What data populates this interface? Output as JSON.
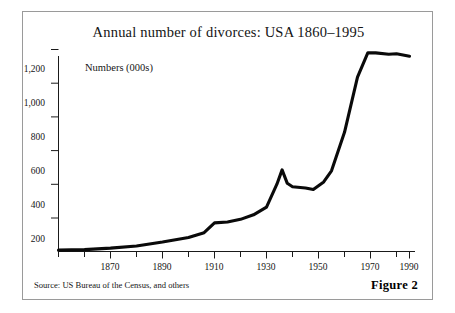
{
  "figure": {
    "title": "Annual number of divorces:  USA 1860–1995",
    "source_note": "Source: US Bureau of the Census, and others",
    "figure_number": "Figure 2",
    "border_color": "#9a9a9a",
    "line_color": "#000000",
    "background": "#ffffff"
  },
  "chart_data": {
    "type": "line",
    "title": "Annual number of divorces:  USA 1860–1995",
    "xlabel": "",
    "ylabel": "Numbers (000s)",
    "ylim": [
      0,
      1280
    ],
    "xlim": [
      1860,
      1995
    ],
    "grid": false,
    "legend": null,
    "y_ticks": [
      200,
      400,
      600,
      800,
      1000,
      1200
    ],
    "y_tick_labels": [
      "200",
      "400",
      "600",
      "800",
      "1,000",
      "1,200"
    ],
    "x_ticks": [
      1870,
      1890,
      1910,
      1930,
      1950,
      1970,
      1990
    ],
    "x_tick_labels": [
      "1870",
      "1890",
      "1910",
      "1930",
      "1950",
      "1970",
      "1990"
    ],
    "x_minor_tick_interval": 10,
    "series": [
      {
        "name": "Annual divorces (000s)",
        "x": [
          1860,
          1870,
          1880,
          1890,
          1900,
          1910,
          1916,
          1920,
          1925,
          1930,
          1935,
          1940,
          1944,
          1946,
          1948,
          1950,
          1955,
          1958,
          1962,
          1965,
          1970,
          1975,
          1979,
          1982,
          1987,
          1990,
          1995
        ],
        "values": [
          8,
          11,
          20,
          33,
          56,
          83,
          112,
          170,
          175,
          191,
          218,
          264,
          400,
          485,
          405,
          385,
          377,
          368,
          413,
          479,
          708,
          1036,
          1181,
          1180,
          1172,
          1175,
          1160
        ]
      }
    ],
    "annotations": [
      {
        "label": "post-war peak",
        "x": 1946,
        "y": 485
      },
      {
        "label": "1950s plateau",
        "x": 1958,
        "y": 368
      },
      {
        "label": "1980s plateau",
        "x": 1979,
        "y": 1181
      }
    ]
  },
  "y_tick_positions": [
    {
      "label": "1,200",
      "top": 52
    },
    {
      "label": "1,000",
      "top": 86
    },
    {
      "label": "800",
      "top": 120
    },
    {
      "label": "600",
      "top": 154
    },
    {
      "label": "400",
      "top": 188
    },
    {
      "label": "200",
      "top": 222
    }
  ],
  "x_tick_positions": [
    {
      "label": "1870",
      "left": 62
    },
    {
      "label": "1890",
      "left": 114
    },
    {
      "label": "1910",
      "left": 166
    },
    {
      "label": "1930",
      "left": 218
    },
    {
      "label": "1950",
      "left": 270
    },
    {
      "label": "1970",
      "left": 322
    },
    {
      "label": "1990",
      "left": 374
    }
  ]
}
